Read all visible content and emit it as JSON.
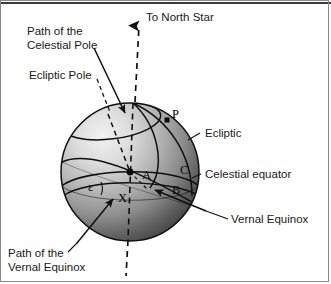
{
  "figure": {
    "type": "astronomy-diagram"
  },
  "colors": {
    "sphere_light": "#e8e8e8",
    "sphere_mid": "#a8a8a8",
    "sphere_dark": "#3c3c3c",
    "line": "#111111",
    "text": "#1a1a1a",
    "frame": "#8a8a8a"
  },
  "labels": {
    "north_star": "To North Star",
    "path_celestial_pole_line1": "Path of the",
    "path_celestial_pole_line2": "Celestial Pole",
    "ecliptic_pole": "Ecliptic Pole",
    "ecliptic": "Ecliptic",
    "celestial_equator": "Celestial equator",
    "vernal_equinox": "Vernal Equinox",
    "path_vernal_equinox_line1": "Path of the",
    "path_vernal_equinox_line2": "Vernal Equinox"
  },
  "points": {
    "p": "P",
    "a": "A",
    "b": "B",
    "c": "C",
    "x": "X",
    "epsilon": "ε"
  },
  "icons": {
    "north_arrow": "up-arrow-icon"
  }
}
